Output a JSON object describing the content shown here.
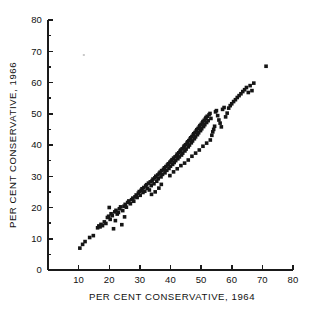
{
  "figure": {
    "title": "",
    "background_color": "#ffffff",
    "point_color": "#151515",
    "axis_color": "#1a1a1a"
  },
  "chart_data": {
    "type": "scatter",
    "title": "",
    "xlabel": "PER CENT CONSERVATIVE, 1964",
    "ylabel": "PER CENT CONSERVATIVE, 1966",
    "xlim": [
      0,
      80
    ],
    "ylim": [
      0,
      80
    ],
    "xticks": [
      10,
      20,
      30,
      40,
      50,
      60,
      70,
      80
    ],
    "xtick_labels": [
      "10",
      "20",
      "30",
      "40",
      "50",
      "60",
      "70",
      "80"
    ],
    "yticks": [
      0,
      10,
      20,
      30,
      40,
      50,
      60,
      70,
      80
    ],
    "ytick_labels": [
      "0",
      "10",
      "20",
      "30",
      "40",
      "50",
      "60",
      "70",
      "80"
    ],
    "y_minor_ticks": [
      5,
      15,
      25,
      35,
      45,
      55,
      65,
      75
    ],
    "grid": false,
    "legend": null,
    "marker": "square-dot",
    "marker_size": 1.8,
    "n_points": 183,
    "points": [
      [
        10.4,
        7.0
      ],
      [
        11.3,
        8.2
      ],
      [
        12.1,
        9.1
      ],
      [
        13.6,
        10.4
      ],
      [
        14.8,
        11.0
      ],
      [
        16.2,
        13.5
      ],
      [
        16.6,
        14.1
      ],
      [
        17.0,
        13.8
      ],
      [
        17.3,
        14.6
      ],
      [
        17.8,
        14.2
      ],
      [
        18.4,
        15.4
      ],
      [
        18.9,
        14.9
      ],
      [
        19.4,
        16.8
      ],
      [
        19.8,
        17.2
      ],
      [
        20.3,
        16.2
      ],
      [
        20.6,
        18.0
      ],
      [
        21.0,
        17.4
      ],
      [
        21.4,
        13.2
      ],
      [
        21.8,
        18.6
      ],
      [
        22.2,
        19.1
      ],
      [
        22.6,
        17.9
      ],
      [
        23.0,
        18.4
      ],
      [
        23.3,
        19.6
      ],
      [
        23.7,
        20.2
      ],
      [
        24.1,
        14.5
      ],
      [
        24.4,
        19.0
      ],
      [
        24.8,
        20.4
      ],
      [
        25.2,
        21.0
      ],
      [
        25.6,
        20.1
      ],
      [
        26.0,
        21.6
      ],
      [
        26.4,
        22.1
      ],
      [
        26.9,
        21.2
      ],
      [
        27.3,
        22.5
      ],
      [
        27.7,
        23.0
      ],
      [
        28.0,
        22.0
      ],
      [
        28.4,
        23.4
      ],
      [
        28.8,
        24.0
      ],
      [
        29.1,
        23.2
      ],
      [
        29.5,
        24.6
      ],
      [
        29.8,
        25.1
      ],
      [
        30.1,
        23.9
      ],
      [
        30.4,
        25.5
      ],
      [
        30.7,
        26.0
      ],
      [
        31.0,
        24.8
      ],
      [
        31.3,
        26.4
      ],
      [
        31.6,
        25.2
      ],
      [
        31.9,
        26.9
      ],
      [
        32.2,
        27.3
      ],
      [
        32.5,
        26.1
      ],
      [
        32.8,
        27.8
      ],
      [
        33.1,
        25.6
      ],
      [
        33.4,
        28.2
      ],
      [
        33.7,
        27.0
      ],
      [
        34.0,
        28.6
      ],
      [
        34.3,
        29.1
      ],
      [
        34.6,
        27.6
      ],
      [
        34.9,
        29.5
      ],
      [
        35.2,
        30.0
      ],
      [
        35.5,
        28.4
      ],
      [
        35.8,
        30.4
      ],
      [
        36.0,
        29.2
      ],
      [
        36.3,
        30.9
      ],
      [
        36.6,
        31.3
      ],
      [
        36.9,
        29.8
      ],
      [
        37.1,
        31.8
      ],
      [
        37.4,
        30.6
      ],
      [
        37.7,
        32.2
      ],
      [
        38.0,
        32.7
      ],
      [
        38.2,
        31.1
      ],
      [
        38.5,
        33.1
      ],
      [
        38.8,
        31.9
      ],
      [
        39.0,
        33.6
      ],
      [
        39.3,
        34.0
      ],
      [
        39.5,
        32.5
      ],
      [
        39.8,
        34.5
      ],
      [
        40.0,
        33.2
      ],
      [
        40.2,
        34.9
      ],
      [
        40.5,
        35.3
      ],
      [
        40.7,
        33.8
      ],
      [
        41.0,
        35.8
      ],
      [
        41.2,
        34.4
      ],
      [
        41.5,
        36.2
      ],
      [
        41.7,
        35.0
      ],
      [
        42.0,
        36.6
      ],
      [
        42.2,
        37.1
      ],
      [
        42.4,
        35.6
      ],
      [
        42.7,
        37.5
      ],
      [
        42.9,
        36.2
      ],
      [
        43.1,
        38.0
      ],
      [
        43.4,
        38.4
      ],
      [
        43.6,
        36.8
      ],
      [
        43.8,
        38.8
      ],
      [
        44.0,
        37.4
      ],
      [
        44.3,
        39.3
      ],
      [
        44.5,
        39.7
      ],
      [
        44.7,
        38.1
      ],
      [
        44.9,
        40.1
      ],
      [
        45.1,
        38.7
      ],
      [
        45.4,
        40.6
      ],
      [
        45.6,
        41.0
      ],
      [
        45.8,
        39.4
      ],
      [
        46.0,
        41.4
      ],
      [
        46.2,
        40.0
      ],
      [
        46.4,
        41.9
      ],
      [
        46.6,
        42.3
      ],
      [
        46.8,
        40.7
      ],
      [
        47.0,
        42.7
      ],
      [
        47.2,
        41.3
      ],
      [
        47.4,
        43.2
      ],
      [
        47.6,
        43.6
      ],
      [
        47.8,
        42.0
      ],
      [
        48.0,
        44.0
      ],
      [
        48.2,
        42.6
      ],
      [
        48.4,
        44.5
      ],
      [
        48.6,
        44.9
      ],
      [
        48.8,
        43.3
      ],
      [
        49.0,
        45.3
      ],
      [
        49.2,
        43.9
      ],
      [
        49.4,
        45.8
      ],
      [
        49.6,
        46.2
      ],
      [
        49.8,
        44.6
      ],
      [
        50.0,
        46.6
      ],
      [
        50.2,
        45.2
      ],
      [
        50.4,
        47.1
      ],
      [
        50.6,
        47.5
      ],
      [
        50.8,
        45.9
      ],
      [
        51.0,
        47.9
      ],
      [
        51.2,
        46.5
      ],
      [
        51.4,
        48.4
      ],
      [
        51.6,
        48.8
      ],
      [
        51.8,
        47.2
      ],
      [
        52.0,
        49.2
      ],
      [
        52.3,
        47.8
      ],
      [
        52.6,
        49.7
      ],
      [
        52.9,
        50.1
      ],
      [
        53.2,
        48.5
      ],
      [
        53.5,
        43.1
      ],
      [
        53.8,
        44.2
      ],
      [
        54.1,
        45.0
      ],
      [
        54.4,
        46.0
      ],
      [
        54.7,
        50.6
      ],
      [
        55.0,
        51.0
      ],
      [
        55.4,
        49.4
      ],
      [
        55.8,
        48.0
      ],
      [
        56.2,
        47.0
      ],
      [
        56.6,
        45.8
      ],
      [
        57.0,
        51.4
      ],
      [
        57.5,
        52.0
      ],
      [
        58.0,
        49.0
      ],
      [
        58.5,
        50.2
      ],
      [
        59.0,
        51.8
      ],
      [
        59.5,
        52.6
      ],
      [
        60.0,
        53.2
      ],
      [
        60.6,
        53.9
      ],
      [
        61.2,
        54.5
      ],
      [
        61.8,
        55.2
      ],
      [
        62.4,
        55.8
      ],
      [
        63.0,
        56.4
      ],
      [
        63.6,
        57.1
      ],
      [
        64.2,
        57.7
      ],
      [
        64.8,
        58.4
      ],
      [
        65.4,
        56.8
      ],
      [
        66.0,
        59.0
      ],
      [
        66.6,
        57.4
      ],
      [
        67.2,
        59.8
      ],
      [
        71.2,
        65.2
      ],
      [
        33.8,
        24.2
      ],
      [
        35.0,
        25.0
      ],
      [
        36.2,
        26.2
      ],
      [
        37.0,
        27.4
      ],
      [
        39.8,
        30.2
      ],
      [
        41.0,
        31.4
      ],
      [
        42.2,
        32.4
      ],
      [
        43.4,
        33.4
      ],
      [
        44.6,
        34.2
      ],
      [
        45.8,
        35.2
      ],
      [
        47.0,
        36.4
      ],
      [
        48.2,
        37.4
      ],
      [
        49.4,
        38.4
      ],
      [
        50.6,
        39.6
      ],
      [
        51.8,
        40.6
      ],
      [
        53.0,
        41.6
      ],
      [
        20.0,
        20.0
      ],
      [
        22.0,
        15.8
      ],
      [
        25.0,
        17.0
      ]
    ],
    "stray_marks": [
      {
        "x": 11.7,
        "y": 68.8,
        "note": "faint speckle"
      }
    ]
  }
}
